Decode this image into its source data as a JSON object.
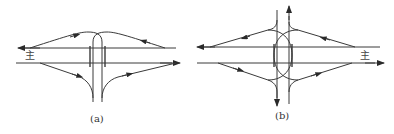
{
  "figure": {
    "panels": [
      {
        "id": "a",
        "caption": "(a)",
        "main_road_label": "主",
        "description": "Partial cloverleaf-like interchange: left-turn ramps loop over the minor road on top side, diagonal ramps on bottom side"
      },
      {
        "id": "b",
        "caption": "(b)",
        "main_road_label": "主",
        "description": "Interchange with crossing ramps on both sides of the minor road, minor road continues vertically with arrows up and down"
      }
    ],
    "colors": {
      "line": "#3a3a3a",
      "background": "#ffffff",
      "text": "#333333"
    },
    "icons": {
      "arrowhead": "filled-triangle-arrow"
    }
  }
}
